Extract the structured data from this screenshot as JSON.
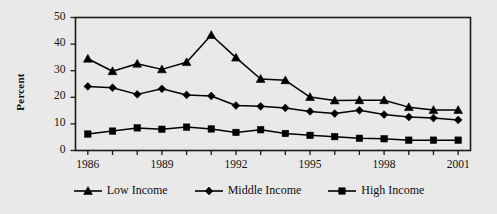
{
  "chart_data": {
    "type": "line",
    "title": "",
    "subtitle": "",
    "xlabel": "",
    "ylabel": "Percent",
    "xlim": [
      1985.5,
      2001.5
    ],
    "ylim": [
      0,
      50
    ],
    "ytick_values": [
      0,
      10,
      20,
      30,
      40,
      50
    ],
    "ytick_labels": [
      "0",
      "10",
      "20",
      "30",
      "40",
      "50"
    ],
    "xtick_values": [
      1986,
      1987,
      1988,
      1989,
      1990,
      1991,
      1992,
      1993,
      1994,
      1995,
      1996,
      1997,
      1998,
      1999,
      2000,
      2001
    ],
    "xtick_labels_shown": [
      "1986",
      "1989",
      "1992",
      "1995",
      "1998",
      "2001"
    ],
    "xtick_labeled_values": [
      1986,
      1989,
      1992,
      1995,
      1998,
      2001
    ],
    "grid": false,
    "legend_position": "bottom",
    "x": [
      1986,
      1987,
      1988,
      1989,
      1990,
      1991,
      1992,
      1993,
      1994,
      1995,
      1996,
      1997,
      1998,
      1999,
      2000,
      2001
    ],
    "series": [
      {
        "name": "Low Income",
        "marker": "triangle",
        "color": "#000000",
        "values": [
          34.5,
          29.8,
          32.6,
          30.5,
          33.2,
          43.4,
          34.9,
          26.9,
          26.4,
          20.1,
          18.8,
          18.9,
          18.9,
          16.3,
          15.2,
          15.2
        ]
      },
      {
        "name": "Middle Income",
        "marker": "diamond",
        "color": "#000000",
        "values": [
          24.1,
          23.6,
          21.1,
          23.2,
          20.9,
          20.5,
          16.9,
          16.6,
          16.0,
          14.7,
          13.9,
          15.1,
          13.5,
          12.6,
          12.2,
          11.5
        ]
      },
      {
        "name": "High Income",
        "marker": "square",
        "color": "#000000",
        "values": [
          6.2,
          7.3,
          8.5,
          8.0,
          8.8,
          8.1,
          6.8,
          7.8,
          6.4,
          5.7,
          5.2,
          4.6,
          4.4,
          3.9,
          3.9,
          3.9
        ]
      }
    ]
  },
  "legend": {
    "items": [
      {
        "label": "Low Income",
        "marker": "triangle"
      },
      {
        "label": "Middle Income",
        "marker": "diamond"
      },
      {
        "label": "High Income",
        "marker": "square"
      }
    ]
  },
  "colors": {
    "background": "#e9e9e9",
    "ink": "#000000",
    "axis": "#1a1a1a"
  }
}
